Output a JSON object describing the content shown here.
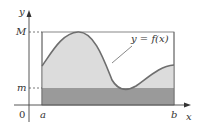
{
  "diagram": {
    "axes": {
      "x_label": "x",
      "y_label": "y",
      "origin_label": "0"
    },
    "bounds": {
      "upper_label": "M",
      "lower_label": "m",
      "left_label": "a",
      "right_label": "b"
    },
    "curve": {
      "label": "y = f(x)"
    },
    "colors": {
      "light_region": "#dcdcdc",
      "dark_region": "#9a9a9a",
      "curve": "#6e6e6e",
      "axis": "#444444",
      "rect_outline": "#6a6a6a"
    }
  }
}
